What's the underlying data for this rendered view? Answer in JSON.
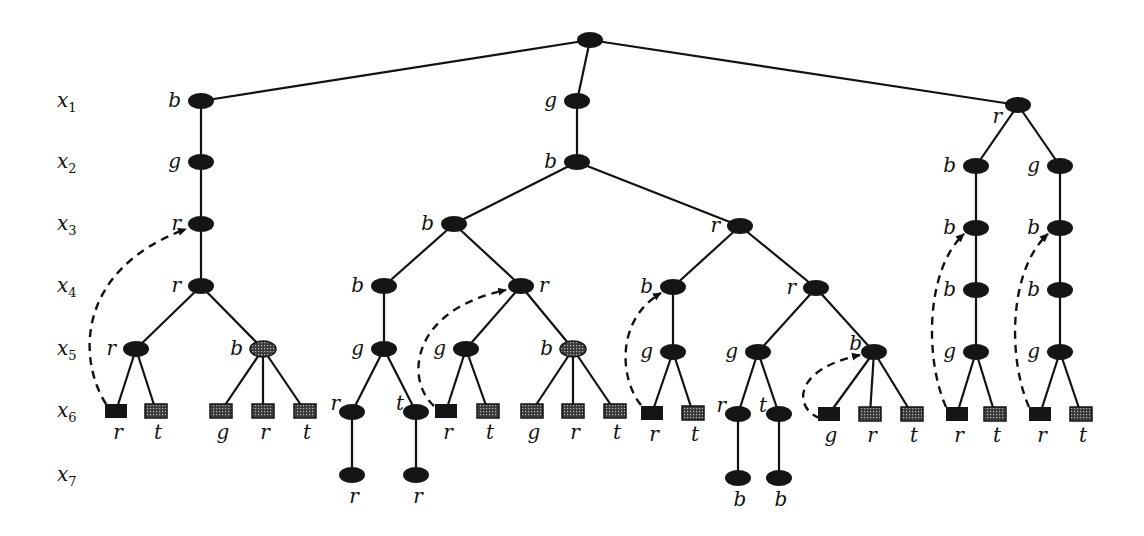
{
  "diagram": {
    "type": "search-tree",
    "row_labels": [
      {
        "name": "x",
        "sub": "1",
        "y": 101
      },
      {
        "name": "x",
        "sub": "2",
        "y": 162
      },
      {
        "name": "x",
        "sub": "3",
        "y": 224
      },
      {
        "name": "x",
        "sub": "4",
        "y": 286
      },
      {
        "name": "x",
        "sub": "5",
        "y": 349
      },
      {
        "name": "x",
        "sub": "6",
        "y": 411
      },
      {
        "name": "x",
        "sub": "7",
        "y": 475
      }
    ],
    "nodes": [
      {
        "id": "root",
        "x": 590,
        "y": 40,
        "shape": "ellipse",
        "fill": "solid",
        "label": "",
        "label_pos": "left"
      },
      {
        "id": "L1",
        "x": 201,
        "y": 101,
        "shape": "ellipse",
        "fill": "solid",
        "label": "b",
        "label_pos": "left",
        "parent": "root"
      },
      {
        "id": "L2",
        "x": 201,
        "y": 162,
        "shape": "ellipse",
        "fill": "solid",
        "label": "g",
        "label_pos": "left",
        "parent": "L1"
      },
      {
        "id": "L3",
        "x": 201,
        "y": 224,
        "shape": "ellipse",
        "fill": "solid",
        "label": "r",
        "label_pos": "left",
        "parent": "L2"
      },
      {
        "id": "L4",
        "x": 201,
        "y": 286,
        "shape": "ellipse",
        "fill": "solid",
        "label": "r",
        "label_pos": "left",
        "parent": "L3"
      },
      {
        "id": "L5a",
        "x": 136,
        "y": 349,
        "shape": "ellipse",
        "fill": "solid",
        "label": "r",
        "label_pos": "left",
        "parent": "L4"
      },
      {
        "id": "L5b",
        "x": 263,
        "y": 349,
        "shape": "ellipse",
        "fill": "hatched",
        "label": "b",
        "label_pos": "left",
        "parent": "L4"
      },
      {
        "id": "L6a",
        "x": 116,
        "y": 411,
        "shape": "rect",
        "fill": "solid",
        "label": "r",
        "label_pos": "below",
        "parent": "L5a"
      },
      {
        "id": "L6b",
        "x": 156,
        "y": 411,
        "shape": "rect",
        "fill": "hatched",
        "label": "t",
        "label_pos": "below",
        "parent": "L5a"
      },
      {
        "id": "L6c",
        "x": 221,
        "y": 411,
        "shape": "rect",
        "fill": "hatched",
        "label": "g",
        "label_pos": "below",
        "parent": "L5b"
      },
      {
        "id": "L6d",
        "x": 263,
        "y": 411,
        "shape": "rect",
        "fill": "hatched",
        "label": "r",
        "label_pos": "below",
        "parent": "L5b"
      },
      {
        "id": "L6e",
        "x": 305,
        "y": 411,
        "shape": "rect",
        "fill": "hatched",
        "label": "t",
        "label_pos": "below",
        "parent": "L5b"
      },
      {
        "id": "M1",
        "x": 577,
        "y": 101,
        "shape": "ellipse",
        "fill": "solid",
        "label": "g",
        "label_pos": "left",
        "parent": "root"
      },
      {
        "id": "M2",
        "x": 577,
        "y": 162,
        "shape": "ellipse",
        "fill": "solid",
        "label": "b",
        "label_pos": "left",
        "parent": "M1"
      },
      {
        "id": "M3a",
        "x": 454,
        "y": 224,
        "shape": "ellipse",
        "fill": "solid",
        "label": "b",
        "label_pos": "left",
        "parent": "M2"
      },
      {
        "id": "M3b",
        "x": 740,
        "y": 226,
        "shape": "ellipse",
        "fill": "solid",
        "label": "r",
        "label_pos": "left",
        "parent": "M2"
      },
      {
        "id": "M4a",
        "x": 384,
        "y": 286,
        "shape": "ellipse",
        "fill": "solid",
        "label": "b",
        "label_pos": "left",
        "parent": "M3a"
      },
      {
        "id": "M4b",
        "x": 521,
        "y": 286,
        "shape": "ellipse",
        "fill": "solid",
        "label": "r",
        "label_pos": "right",
        "parent": "M3a"
      },
      {
        "id": "M5a",
        "x": 384,
        "y": 349,
        "shape": "ellipse",
        "fill": "solid",
        "label": "g",
        "label_pos": "left",
        "parent": "M4a"
      },
      {
        "id": "M6a",
        "x": 352,
        "y": 412,
        "shape": "ellipse",
        "fill": "solid",
        "label": "r",
        "label_pos": "upleft",
        "parent": "M5a"
      },
      {
        "id": "M6b",
        "x": 416,
        "y": 412,
        "shape": "ellipse",
        "fill": "solid",
        "label": "t",
        "label_pos": "upleft",
        "parent": "M5a"
      },
      {
        "id": "M7a",
        "x": 352,
        "y": 475,
        "shape": "ellipse",
        "fill": "solid",
        "label": "r",
        "label_pos": "below",
        "parent": "M6a"
      },
      {
        "id": "M7b",
        "x": 416,
        "y": 475,
        "shape": "ellipse",
        "fill": "solid",
        "label": "r",
        "label_pos": "below",
        "parent": "M6b"
      },
      {
        "id": "M5b",
        "x": 466,
        "y": 349,
        "shape": "ellipse",
        "fill": "solid",
        "label": "g",
        "label_pos": "left",
        "parent": "M4b"
      },
      {
        "id": "M5c",
        "x": 573,
        "y": 349,
        "shape": "ellipse",
        "fill": "hatched",
        "label": "b",
        "label_pos": "left",
        "parent": "M4b"
      },
      {
        "id": "M6c",
        "x": 446,
        "y": 411,
        "shape": "rect",
        "fill": "solid",
        "label": "r",
        "label_pos": "below",
        "parent": "M5b"
      },
      {
        "id": "M6d",
        "x": 488,
        "y": 411,
        "shape": "rect",
        "fill": "hatched",
        "label": "t",
        "label_pos": "below",
        "parent": "M5b"
      },
      {
        "id": "M6e",
        "x": 532,
        "y": 411,
        "shape": "rect",
        "fill": "hatched",
        "label": "g",
        "label_pos": "below",
        "parent": "M5c"
      },
      {
        "id": "M6f",
        "x": 573,
        "y": 411,
        "shape": "rect",
        "fill": "hatched",
        "label": "r",
        "label_pos": "below",
        "parent": "M5c"
      },
      {
        "id": "M6g",
        "x": 615,
        "y": 411,
        "shape": "rect",
        "fill": "hatched",
        "label": "t",
        "label_pos": "below",
        "parent": "M5c"
      },
      {
        "id": "N4a",
        "x": 673,
        "y": 287,
        "shape": "ellipse",
        "fill": "solid",
        "label": "b",
        "label_pos": "left",
        "parent": "M3b"
      },
      {
        "id": "N4b",
        "x": 816,
        "y": 288,
        "shape": "ellipse",
        "fill": "solid",
        "label": "r",
        "label_pos": "left",
        "parent": "M3b"
      },
      {
        "id": "N5a",
        "x": 673,
        "y": 352,
        "shape": "ellipse",
        "fill": "solid",
        "label": "g",
        "label_pos": "left",
        "parent": "N4a"
      },
      {
        "id": "N6a",
        "x": 652,
        "y": 413,
        "shape": "rect",
        "fill": "solid",
        "label": "r",
        "label_pos": "below",
        "parent": "N5a"
      },
      {
        "id": "N6b",
        "x": 693,
        "y": 413,
        "shape": "rect",
        "fill": "hatched",
        "label": "t",
        "label_pos": "below",
        "parent": "N5a"
      },
      {
        "id": "N5b",
        "x": 758,
        "y": 352,
        "shape": "ellipse",
        "fill": "solid",
        "label": "g",
        "label_pos": "left",
        "parent": "N4b"
      },
      {
        "id": "N6c",
        "x": 738,
        "y": 414,
        "shape": "ellipse",
        "fill": "solid",
        "label": "r",
        "label_pos": "upleft",
        "parent": "N5b"
      },
      {
        "id": "N6d",
        "x": 779,
        "y": 414,
        "shape": "ellipse",
        "fill": "solid",
        "label": "t",
        "label_pos": "upleft",
        "parent": "N5b"
      },
      {
        "id": "N7a",
        "x": 738,
        "y": 478,
        "shape": "ellipse",
        "fill": "solid",
        "label": "b",
        "label_pos": "below",
        "parent": "N6c"
      },
      {
        "id": "N7b",
        "x": 779,
        "y": 478,
        "shape": "ellipse",
        "fill": "solid",
        "label": "b",
        "label_pos": "below",
        "parent": "N6d"
      },
      {
        "id": "N5c",
        "x": 874,
        "y": 352,
        "shape": "ellipse",
        "fill": "solid",
        "label": "b",
        "label_pos": "upleft",
        "parent": "N4b"
      },
      {
        "id": "N6e",
        "x": 829,
        "y": 414,
        "shape": "rect",
        "fill": "solid",
        "label": "g",
        "label_pos": "below",
        "parent": "N5c"
      },
      {
        "id": "N6f",
        "x": 870,
        "y": 414,
        "shape": "rect",
        "fill": "hatched",
        "label": "r",
        "label_pos": "below",
        "parent": "N5c"
      },
      {
        "id": "N6g",
        "x": 912,
        "y": 414,
        "shape": "rect",
        "fill": "hatched",
        "label": "t",
        "label_pos": "below",
        "parent": "N5c"
      },
      {
        "id": "R1",
        "x": 1018,
        "y": 105,
        "shape": "ellipse",
        "fill": "solid",
        "label": "r",
        "label_pos": "downleft",
        "parent": "root"
      },
      {
        "id": "R2a",
        "x": 976,
        "y": 166,
        "shape": "ellipse",
        "fill": "solid",
        "label": "b",
        "label_pos": "left",
        "parent": "R1"
      },
      {
        "id": "R3a",
        "x": 976,
        "y": 228,
        "shape": "ellipse",
        "fill": "solid",
        "label": "b",
        "label_pos": "left",
        "parent": "R2a"
      },
      {
        "id": "R4a",
        "x": 976,
        "y": 290,
        "shape": "ellipse",
        "fill": "solid",
        "label": "b",
        "label_pos": "left",
        "parent": "R3a"
      },
      {
        "id": "R5a",
        "x": 976,
        "y": 352,
        "shape": "ellipse",
        "fill": "solid",
        "label": "g",
        "label_pos": "left",
        "parent": "R4a"
      },
      {
        "id": "R6a",
        "x": 957,
        "y": 414,
        "shape": "rect",
        "fill": "solid",
        "label": "r",
        "label_pos": "below",
        "parent": "R5a"
      },
      {
        "id": "R6b",
        "x": 995,
        "y": 414,
        "shape": "rect",
        "fill": "hatched",
        "label": "t",
        "label_pos": "below",
        "parent": "R5a"
      },
      {
        "id": "R2b",
        "x": 1060,
        "y": 166,
        "shape": "ellipse",
        "fill": "solid",
        "label": "g",
        "label_pos": "left",
        "parent": "R1"
      },
      {
        "id": "R3b",
        "x": 1060,
        "y": 228,
        "shape": "ellipse",
        "fill": "solid",
        "label": "b",
        "label_pos": "left",
        "parent": "R2b"
      },
      {
        "id": "R4b",
        "x": 1060,
        "y": 290,
        "shape": "ellipse",
        "fill": "solid",
        "label": "b",
        "label_pos": "left",
        "parent": "R3b"
      },
      {
        "id": "R5b",
        "x": 1060,
        "y": 352,
        "shape": "ellipse",
        "fill": "solid",
        "label": "g",
        "label_pos": "left",
        "parent": "R4b"
      },
      {
        "id": "R6c",
        "x": 1040,
        "y": 414,
        "shape": "rect",
        "fill": "solid",
        "label": "r",
        "label_pos": "below",
        "parent": "R5b"
      },
      {
        "id": "R6d",
        "x": 1081,
        "y": 414,
        "shape": "rect",
        "fill": "hatched",
        "label": "t",
        "label_pos": "below",
        "parent": "R5b"
      }
    ],
    "backjumps": [
      {
        "from": "L6a",
        "to": "L3",
        "path": "M 106 404 C 78 360, 75 270, 186 229"
      },
      {
        "from": "M6c",
        "to": "M4b",
        "path": "M 434 406 C 405 380, 410 310, 506 290"
      },
      {
        "from": "N6a",
        "to": "N4a",
        "path": "M 641 405 C 620 380, 615 320, 661 293"
      },
      {
        "from": "N6e",
        "to": "N5c",
        "path": "M 820 418 C 795 410, 790 370, 860 355"
      },
      {
        "from": "R6a",
        "to": "R3a",
        "path": "M 946 407 C 925 360, 925 270, 964 234"
      },
      {
        "from": "R6c",
        "to": "R3b",
        "path": "M 1029 407 C 1008 360, 1008 270, 1048 234"
      }
    ],
    "colors": {
      "ink": "#151515",
      "background": "#ffffff"
    }
  }
}
